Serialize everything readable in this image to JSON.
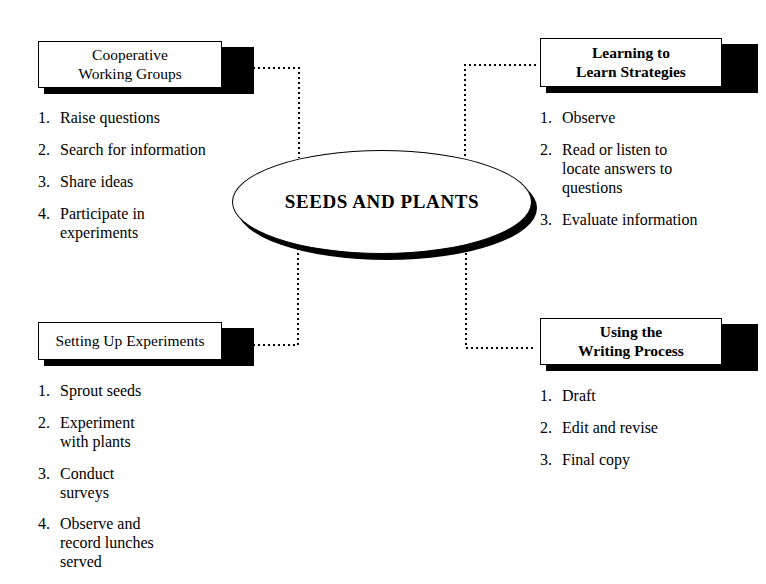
{
  "hub": {
    "label": "SEEDS AND PLANTS",
    "shape": "ellipse-icon"
  },
  "quadrants": {
    "top_left": {
      "title": "Cooperative\nWorking Groups",
      "items": [
        {
          "num": "1.",
          "text": "Raise questions"
        },
        {
          "num": "2.",
          "text": "Search for information"
        },
        {
          "num": "3.",
          "text": "Share ideas"
        },
        {
          "num": "4.",
          "text": "Participate in\nexperiments"
        }
      ]
    },
    "top_right": {
      "title": "Learning to\nLearn Strategies",
      "items": [
        {
          "num": "1.",
          "text": "Observe"
        },
        {
          "num": "2.",
          "text": "Read or listen to\nlocate answers to\nquestions"
        },
        {
          "num": "3.",
          "text": "Evaluate information"
        }
      ]
    },
    "bottom_left": {
      "title": "Setting Up Experiments",
      "items": [
        {
          "num": "1.",
          "text": "Sprout seeds"
        },
        {
          "num": "2.",
          "text": "Experiment\nwith plants"
        },
        {
          "num": "3.",
          "text": "Conduct\nsurveys"
        },
        {
          "num": "4.",
          "text": "Observe and\nrecord lunches\nserved"
        }
      ]
    },
    "bottom_right": {
      "title": "Using the\nWriting Process",
      "items": [
        {
          "num": "1.",
          "text": "Draft"
        },
        {
          "num": "2.",
          "text": "Edit and revise"
        },
        {
          "num": "3.",
          "text": "Final copy"
        }
      ]
    }
  },
  "colors": {
    "background": "#ffffff",
    "ink": "#000000",
    "shadow": "#000000"
  }
}
